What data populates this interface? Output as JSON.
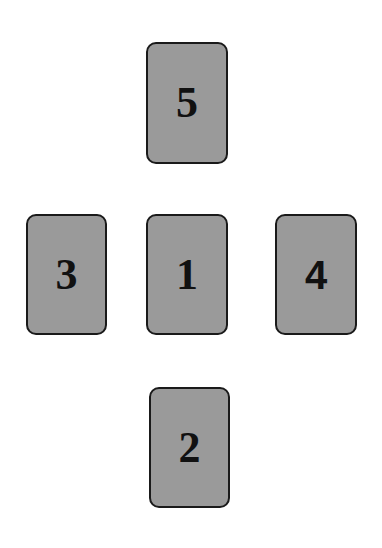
{
  "diagram": {
    "type": "card-spread-layout",
    "card_fill_color": "#9a9a9a",
    "card_border_color": "#1a1a1a",
    "background_color": "#ffffff",
    "cards": [
      {
        "label": "5",
        "position": "top"
      },
      {
        "label": "3",
        "position": "left"
      },
      {
        "label": "1",
        "position": "center"
      },
      {
        "label": "4",
        "position": "right"
      },
      {
        "label": "2",
        "position": "bottom"
      }
    ]
  }
}
